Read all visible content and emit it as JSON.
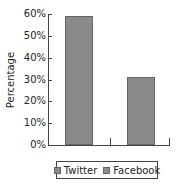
{
  "chart_data": {
    "type": "bar",
    "title": "",
    "xlabel": "",
    "ylabel": "Percentage",
    "categories": [
      "Twitter",
      "Facebook"
    ],
    "values": [
      59,
      31
    ],
    "ylim": [
      0,
      60
    ],
    "yticks": [
      "0%",
      "10%",
      "20%",
      "30%",
      "40%",
      "50%",
      "60%"
    ],
    "legend": [
      "Twitter",
      "Facebook"
    ],
    "legend_position": "bottom",
    "grid": false,
    "bar_color": "#8a8a8a"
  }
}
